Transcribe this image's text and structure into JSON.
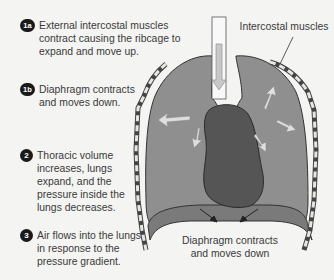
{
  "steps": [
    {
      "badge": "1a",
      "text_lines": [
        "External intercostal muscles",
        "contract causing the ribcage to",
        "expand and move up."
      ]
    },
    {
      "badge": "1b",
      "text_lines": [
        "Diaphragm contracts",
        "and moves down."
      ]
    },
    {
      "badge": "2",
      "text_lines": [
        "Thoracic volume",
        "increases, lungs",
        "expand, and the",
        "pressure inside the",
        "lungs decreases."
      ]
    },
    {
      "badge": "3",
      "text_lines": [
        "Air flows into the lungs",
        "in response to the",
        "pressure gradient."
      ]
    }
  ],
  "labels": {
    "intercostal": "Intercostal muscles",
    "diaphragm_line1": "Diaphragm contracts",
    "diaphragm_line2": "and moves down"
  },
  "colors": {
    "background": "#f4f4f2",
    "lung": "#8e8e8e",
    "heart": "#555555",
    "arrow": "#d8d8d8",
    "badge": "#1a1a1a"
  }
}
